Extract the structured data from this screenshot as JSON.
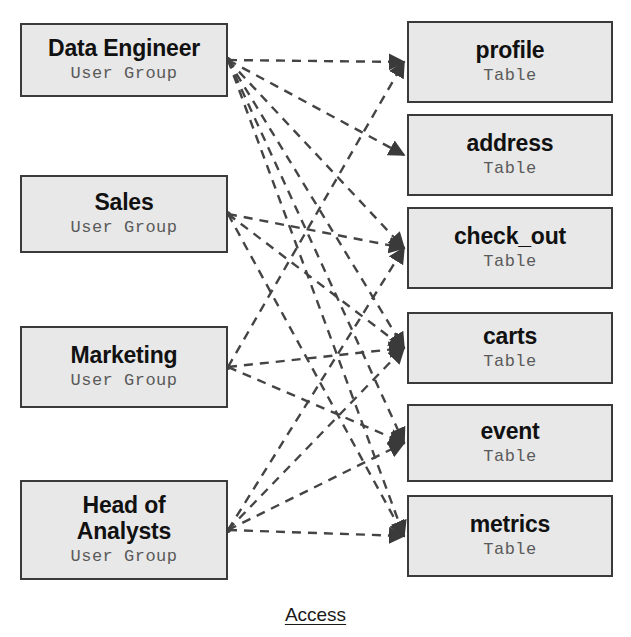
{
  "diagram": {
    "caption": "Access",
    "edge_style": "dashed-arrow",
    "colors": {
      "node_fill": "#e8e8e8",
      "node_border": "#3a3a3a",
      "edge": "#444444",
      "title_text": "#111111",
      "subtitle_text": "#5a5a5a",
      "background": "#ffffff"
    },
    "user_groups": [
      {
        "id": "data_engineer",
        "title": "Data Engineer",
        "subtitle": "User Group",
        "x": 20,
        "y": 23,
        "w": 208,
        "h": 74
      },
      {
        "id": "sales",
        "title": "Sales",
        "subtitle": "User Group",
        "x": 20,
        "y": 175,
        "w": 208,
        "h": 78
      },
      {
        "id": "marketing",
        "title": "Marketing",
        "subtitle": "User Group",
        "x": 20,
        "y": 326,
        "w": 208,
        "h": 82
      },
      {
        "id": "head_of_analysts",
        "title": "Head of\nAnalysts",
        "subtitle": "User Group",
        "x": 20,
        "y": 480,
        "w": 208,
        "h": 100
      }
    ],
    "tables": [
      {
        "id": "profile",
        "title": "profile",
        "subtitle": "Table",
        "x": 407,
        "y": 21,
        "w": 206,
        "h": 82
      },
      {
        "id": "address",
        "title": "address",
        "subtitle": "Table",
        "x": 407,
        "y": 114,
        "w": 206,
        "h": 82
      },
      {
        "id": "check_out",
        "title": "check_out",
        "subtitle": "Table",
        "x": 407,
        "y": 207,
        "w": 206,
        "h": 82
      },
      {
        "id": "carts",
        "title": "carts",
        "subtitle": "Table",
        "x": 407,
        "y": 312,
        "w": 206,
        "h": 72
      },
      {
        "id": "event",
        "title": "event",
        "subtitle": "Table",
        "x": 407,
        "y": 404,
        "w": 206,
        "h": 78
      },
      {
        "id": "metrics",
        "title": "metrics",
        "subtitle": "Table",
        "x": 407,
        "y": 495,
        "w": 206,
        "h": 82
      }
    ],
    "edges": [
      {
        "from": "data_engineer",
        "to": "profile"
      },
      {
        "from": "data_engineer",
        "to": "address"
      },
      {
        "from": "data_engineer",
        "to": "check_out"
      },
      {
        "from": "data_engineer",
        "to": "carts"
      },
      {
        "from": "data_engineer",
        "to": "event"
      },
      {
        "from": "data_engineer",
        "to": "metrics"
      },
      {
        "from": "sales",
        "to": "check_out"
      },
      {
        "from": "sales",
        "to": "carts"
      },
      {
        "from": "sales",
        "to": "metrics"
      },
      {
        "from": "marketing",
        "to": "profile"
      },
      {
        "from": "marketing",
        "to": "carts"
      },
      {
        "from": "marketing",
        "to": "event"
      },
      {
        "from": "head_of_analysts",
        "to": "check_out"
      },
      {
        "from": "head_of_analysts",
        "to": "carts"
      },
      {
        "from": "head_of_analysts",
        "to": "event"
      },
      {
        "from": "head_of_analysts",
        "to": "metrics"
      }
    ],
    "caption_pos": {
      "y": 604
    }
  }
}
